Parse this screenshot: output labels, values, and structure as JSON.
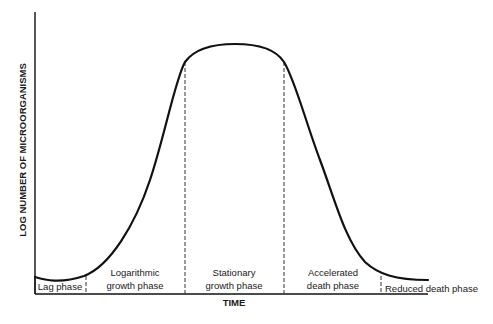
{
  "diagram": {
    "type": "bacterial growth curve",
    "y_axis_label": "LOG NUMBER OF MICROORGANISMS",
    "x_axis_label": "TIME",
    "phases": [
      {
        "id": "lag",
        "line1": "Lag phase",
        "line2": ""
      },
      {
        "id": "log",
        "line1": "Logarithmic",
        "line2": "growth phase"
      },
      {
        "id": "stationary",
        "line1": "Stationary",
        "line2": "growth phase"
      },
      {
        "id": "accelerated-death",
        "line1": "Accelerated",
        "line2": "death phase"
      },
      {
        "id": "reduced-death",
        "line1": "Reduced death phase",
        "line2": ""
      }
    ],
    "colors": {
      "line": "#111111",
      "text": "#1a1a1a",
      "background": "#ffffff"
    }
  }
}
